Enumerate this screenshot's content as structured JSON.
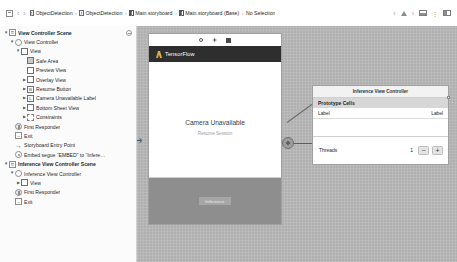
{
  "toolbar": {
    "panel_toggle_icon": "sidebar-panel-icon",
    "back_icon": "chevron-left-icon",
    "forward_icon": "chevron-right-icon",
    "breadcrumbs": [
      {
        "label": "ObjectDetection",
        "icon": "project-icon"
      },
      {
        "label": "ObjectDetection",
        "icon": "folder-icon"
      },
      {
        "label": "Main.storyboard",
        "icon": "storyboard-icon"
      },
      {
        "label": "Main.storyboard (Base)",
        "icon": "storyboard-icon"
      },
      {
        "label": "No Selection",
        "icon": "none"
      }
    ],
    "separator": "›",
    "nav_back_icon": "chevron-left-icon",
    "warning_icon": "warning-triangle-icon",
    "nav_forward_icon": "chevron-right-icon",
    "bottom_panel_icon": "bottom-panel-icon",
    "overflow_icon": "overflow-dots-icon",
    "right_panel_icon": "right-panel-icon"
  },
  "outline": {
    "rows": [
      {
        "label": "View Controller Scene",
        "indent": 0,
        "twisty": "▼",
        "icon": "ic-scene",
        "bold": true,
        "gear": true
      },
      {
        "label": "View Controller",
        "indent": 1,
        "twisty": "▼",
        "icon": "ic-vc",
        "bold": false,
        "gear": false
      },
      {
        "label": "View",
        "indent": 2,
        "twisty": "▼",
        "icon": "ic-view",
        "bold": false,
        "gear": false
      },
      {
        "label": "Safe Area",
        "indent": 3,
        "twisty": "",
        "icon": "ic-view-filled",
        "bold": false,
        "gear": false
      },
      {
        "label": "Preview View",
        "indent": 3,
        "twisty": "",
        "icon": "ic-view",
        "bold": false,
        "gear": false
      },
      {
        "label": "Overlay View",
        "indent": 3,
        "twisty": "▶",
        "icon": "ic-view",
        "bold": false,
        "gear": false
      },
      {
        "label": "Resume Button",
        "indent": 3,
        "twisty": "▶",
        "icon": "ic-letter",
        "letter": "B",
        "bold": false,
        "gear": false
      },
      {
        "label": "Camera Unavailable Label",
        "indent": 3,
        "twisty": "▶",
        "icon": "ic-letter",
        "letter": "L",
        "bold": false,
        "gear": false
      },
      {
        "label": "Bottom Sheet View",
        "indent": 3,
        "twisty": "▶",
        "icon": "ic-view",
        "bold": false,
        "gear": false
      },
      {
        "label": "Constraints",
        "indent": 3,
        "twisty": "▶",
        "icon": "ic-constraint",
        "bold": false,
        "gear": false
      },
      {
        "label": "First Responder",
        "indent": 1,
        "twisty": "",
        "icon": "ic-resp",
        "bold": false,
        "gear": false
      },
      {
        "label": "Exit",
        "indent": 1,
        "twisty": "",
        "icon": "ic-exit",
        "letter": "→",
        "bold": false,
        "gear": false
      },
      {
        "label": "Storyboard Entry Point",
        "indent": 1,
        "twisty": "",
        "icon": "ic-entry",
        "letter": "→",
        "bold": false,
        "gear": false
      },
      {
        "label": "Embed segue “EMBED” to “Infere…",
        "indent": 1,
        "twisty": "",
        "icon": "ic-segue",
        "bold": false,
        "gear": false
      },
      {
        "label": "Inference View Controller Scene",
        "indent": 0,
        "twisty": "▼",
        "icon": "ic-scene",
        "bold": true,
        "gear": false
      },
      {
        "label": "Inference View Controller",
        "indent": 1,
        "twisty": "▼",
        "icon": "ic-vc",
        "bold": false,
        "gear": false
      },
      {
        "label": "View",
        "indent": 2,
        "twisty": "▶",
        "icon": "ic-view",
        "bold": false,
        "gear": false
      },
      {
        "label": "First Responder",
        "indent": 1,
        "twisty": "",
        "icon": "ic-resp",
        "bold": false,
        "gear": false
      },
      {
        "label": "Exit",
        "indent": 1,
        "twisty": "",
        "icon": "ic-exit",
        "letter": "→",
        "bold": false,
        "gear": false
      }
    ]
  },
  "canvas": {
    "scene": {
      "nav_title": "TensorFlow",
      "logo_icon": "tensorflow-logo-icon",
      "status_icons": [
        "circle-icon",
        "sparkle-icon",
        "square-icon"
      ],
      "center_title": "Camera Unavailable",
      "center_subtitle": "Resume Session",
      "sheet_label": "Inference"
    },
    "entry_arrow_icon": "storyboard-entry-arrow-icon",
    "segue_icon": "embed-segue-icon"
  },
  "inference_scene": {
    "header": "Inference View Controller",
    "section_title": "Prototype Cells",
    "cell_left": "Label",
    "cell_right": "Label",
    "threads_label": "Threads",
    "threads_value": "1",
    "minus_label": "−",
    "plus_label": "+"
  },
  "colors": {
    "canvas_bg": "#b0b0b0",
    "navbar": "#2e2e2e",
    "accent": "#d8a23a",
    "sheet": "#8e8e8e"
  }
}
